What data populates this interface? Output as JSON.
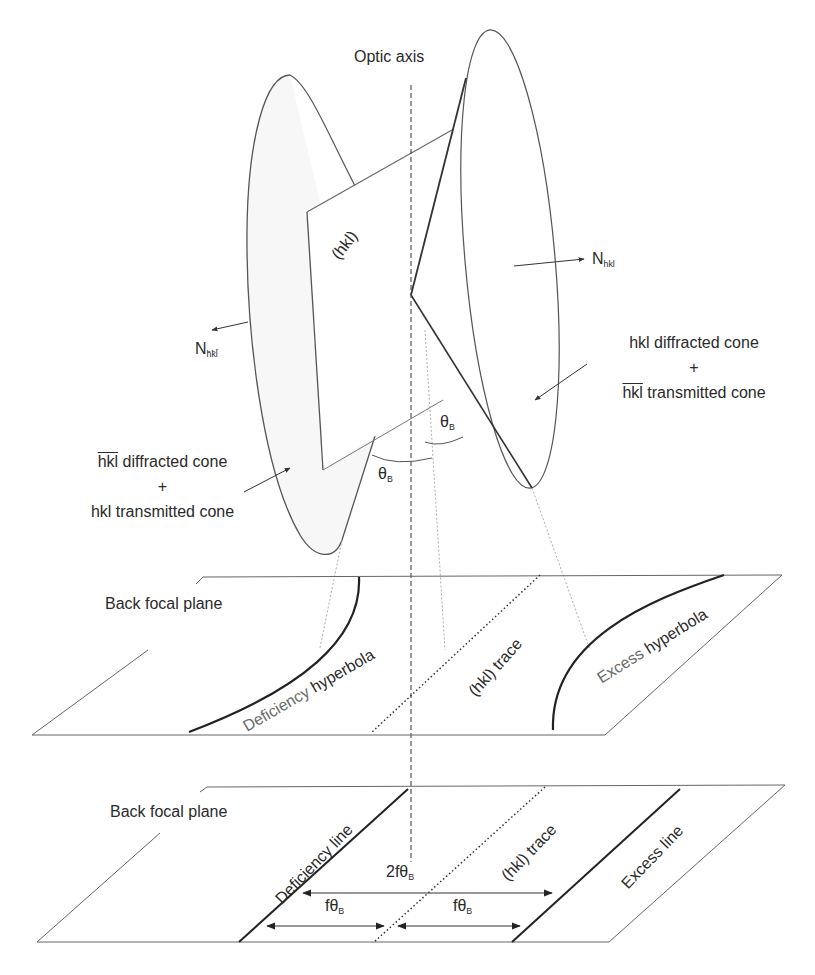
{
  "figure": {
    "optic_axis_label": "Optic axis",
    "plane_label": "(hkl)",
    "normal_hkl": {
      "base": "N",
      "sub": "hkl"
    },
    "normal_bar_hkl": {
      "base": "N",
      "sub": "h̄k̄l̄"
    },
    "right_cone_caption": {
      "line1": "hkl diffracted cone",
      "line2": "+",
      "line3_bar": "hkl",
      "line3_rest": " transmitted cone"
    },
    "left_cone_caption": {
      "line1_bar": "hkl",
      "line1_rest": " diffracted cone",
      "line2": "+",
      "line3": "hkl transmitted cone"
    },
    "theta_b_upper": {
      "base": "θ",
      "sub": "B"
    },
    "theta_b_lower": {
      "base": "θ",
      "sub": "B"
    }
  },
  "middle_plane": {
    "label": "Back focal plane",
    "deficiency_label_part1": "Deficiency",
    "deficiency_label_part2": " hyperbola",
    "trace_label": "(hkl) trace",
    "excess_label_part1": "Excess",
    "excess_label_part2": " hyperbola"
  },
  "bottom_plane": {
    "label": "Back focal plane",
    "deficiency_line_label": "Deficiency line",
    "trace_label": "(hkl) trace",
    "excess_line_label": "Excess line",
    "dim_total": {
      "base": "2fθ",
      "sub": "B"
    },
    "dim_left": {
      "base": "fθ",
      "sub": "B"
    },
    "dim_right": {
      "base": "fθ",
      "sub": "B"
    }
  },
  "colors": {
    "line": "#555555",
    "thick_line": "#222222",
    "text": "#2a2a2a",
    "grey_text": "#6a6a6a"
  }
}
